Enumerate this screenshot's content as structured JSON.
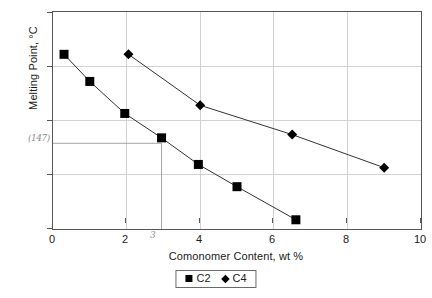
{
  "chart_data": {
    "type": "line",
    "title": "",
    "xlabel": "Comonomer Content, wt %",
    "ylabel": "Melting Point, °C",
    "xlim": [
      0,
      10
    ],
    "ylim": [
      130,
      170
    ],
    "xticks": [
      "0",
      "2",
      "4",
      "6",
      "8",
      "10"
    ],
    "yticks": [
      "130",
      "140",
      "150",
      "160",
      "170"
    ],
    "grid": true,
    "legend_position": "bottom-center",
    "markers": {
      "C2": "filled-square",
      "C4": "filled-diamond"
    },
    "series": [
      {
        "name": "C2",
        "marker": "filled-square",
        "x": [
          0.3,
          1.0,
          1.95,
          2.95,
          3.95,
          5.0,
          6.6
        ],
        "y": [
          162.2,
          157.2,
          151.3,
          146.8,
          141.9,
          137.8,
          131.7
        ]
      },
      {
        "name": "C4",
        "marker": "filled-diamond",
        "x": [
          2.05,
          4.0,
          6.5,
          9.0
        ],
        "y": [
          162.2,
          152.8,
          147.4,
          141.3
        ]
      }
    ],
    "annotations": [
      {
        "name": "y-axis-hand-annotation",
        "text": "(147)",
        "axis": "y",
        "value": 145.8
      },
      {
        "name": "x-axis-hand-annotation",
        "text": "3",
        "axis": "x",
        "value": 2.95
      }
    ],
    "guide_lines": [
      {
        "name": "horizontal-guide",
        "from": [
          0,
          145.8
        ],
        "to": [
          2.95,
          145.8
        ]
      },
      {
        "name": "vertical-guide",
        "from": [
          2.95,
          145.8
        ],
        "to": [
          2.95,
          130
        ]
      }
    ]
  },
  "legend": {
    "entries": [
      {
        "label": "C2",
        "marker": "square-marker-icon"
      },
      {
        "label": "C4",
        "marker": "diamond-marker-icon"
      }
    ]
  }
}
